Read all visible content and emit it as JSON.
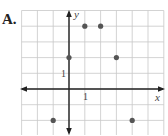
{
  "problem": {
    "label": "A."
  },
  "chart_data": {
    "type": "scatter",
    "title": "",
    "xlabel": "x",
    "ylabel": "y",
    "x_tick_label": "1",
    "y_tick_label": "1",
    "xlim": [
      -3,
      6
    ],
    "ylim": [
      -3,
      5
    ],
    "grid": true,
    "points": [
      {
        "x": 1,
        "y": 4
      },
      {
        "x": 2,
        "y": 4
      },
      {
        "x": 0,
        "y": 2
      },
      {
        "x": 3,
        "y": 2
      },
      {
        "x": -1,
        "y": -2
      },
      {
        "x": 4,
        "y": -2
      }
    ],
    "colors": {
      "grid": "#c8c8c8",
      "axis": "#222222",
      "point": "#555555"
    }
  }
}
